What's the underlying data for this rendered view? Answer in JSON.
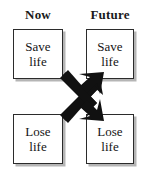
{
  "diagram": {
    "title_visible": false,
    "columns": [
      {
        "id": "now",
        "label": "Now"
      },
      {
        "id": "future",
        "label": "Future"
      }
    ],
    "nodes": [
      {
        "id": "now-save",
        "column": "now",
        "row": "top",
        "line1": "Save",
        "line2": "life"
      },
      {
        "id": "future-save",
        "column": "future",
        "row": "top",
        "line1": "Save",
        "line2": "life"
      },
      {
        "id": "now-lose",
        "column": "now",
        "row": "bottom",
        "line1": "Lose",
        "line2": "life"
      },
      {
        "id": "future-lose",
        "column": "future",
        "row": "bottom",
        "line1": "Lose",
        "line2": "life"
      }
    ],
    "arrows": [
      {
        "id": "arrow-lose-to-save",
        "name": "arrow-now-lose-to-future-save",
        "from": "now-lose",
        "to": "future-save",
        "direction": "up-right",
        "style": "thick-solid-block",
        "color": "#111111"
      },
      {
        "id": "arrow-save-to-lose",
        "name": "arrow-now-save-to-future-lose",
        "from": "now-save",
        "to": "future-lose",
        "direction": "down-right",
        "style": "thick-solid-block",
        "color": "#111111"
      }
    ],
    "colors": {
      "background": "#ffffff",
      "box_border": "#2b2b2b",
      "box_fill": "#ffffff",
      "box_shadow": "#787878",
      "text": "#141414",
      "arrow": "#111111"
    }
  }
}
